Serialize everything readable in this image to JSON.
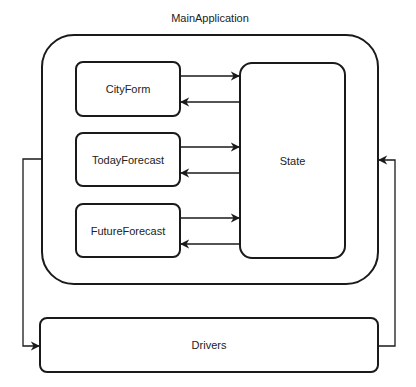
{
  "diagram": {
    "title": "MainApplication",
    "container": {
      "label": "MainApplication"
    },
    "nodes": [
      {
        "id": "cityform",
        "label": "CityForm"
      },
      {
        "id": "todayforecast",
        "label": "TodayForecast"
      },
      {
        "id": "futureforecast",
        "label": "FutureForecast"
      },
      {
        "id": "state",
        "label": "State"
      },
      {
        "id": "drivers",
        "label": "Drivers"
      }
    ],
    "edges": [
      {
        "from": "CityForm",
        "to": "State"
      },
      {
        "from": "State",
        "to": "CityForm"
      },
      {
        "from": "TodayForecast",
        "to": "State"
      },
      {
        "from": "State",
        "to": "TodayForecast"
      },
      {
        "from": "FutureForecast",
        "to": "State"
      },
      {
        "from": "State",
        "to": "FutureForecast"
      },
      {
        "from": "MainApplication",
        "to": "Drivers"
      },
      {
        "from": "Drivers",
        "to": "MainApplication"
      }
    ],
    "colors": {
      "stroke": "#1a1a1a",
      "fill": "#ffffff",
      "text": "#222222"
    }
  }
}
